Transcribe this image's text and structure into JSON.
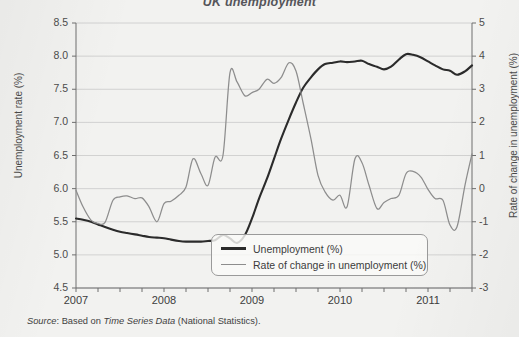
{
  "chart_data": {
    "type": "line",
    "title": "UK unemployment",
    "source": "Based on Time Series Data (National Statistics).",
    "source_prefix": "Source",
    "source_italic": "Time Series Data",
    "source_suffix": "(National Statistics).",
    "xlabel": "",
    "ylabel": "Unemployment rate (%)",
    "ylabel_right": "Rate of change in unemployment (%)",
    "ylim": [
      4.5,
      8.5
    ],
    "ylim_right": [
      -3,
      5
    ],
    "grid": true,
    "legend_position": "lower-center",
    "yticks": [
      "8.5",
      "8.0",
      "7.5",
      "7.0",
      "6.5",
      "6.0",
      "5.5",
      "5.0",
      "4.5"
    ],
    "yticks_right": [
      "5",
      "4",
      "3",
      "2",
      "1",
      "0",
      "-1",
      "-2",
      "-3"
    ],
    "xticks": [
      "2007",
      "2008",
      "2009",
      "2010",
      "2011"
    ],
    "xtick_minor_count": 18,
    "x_range": [
      "2007.00",
      "2011.50"
    ],
    "colors": {
      "unemployment": "#2b2b2b",
      "rate_of_change": "#8d8d8d",
      "grid": "#c9c9c9",
      "axis": "#6e6e6e",
      "background": "#f2f2f0"
    },
    "series": [
      {
        "name": "Unemployment (%)",
        "axis": "left",
        "x": [
          2007.0,
          2007.08,
          2007.17,
          2007.25,
          2007.33,
          2007.42,
          2007.5,
          2007.58,
          2007.67,
          2007.75,
          2007.83,
          2007.92,
          2008.0,
          2008.08,
          2008.17,
          2008.25,
          2008.33,
          2008.42,
          2008.5,
          2008.58,
          2008.67,
          2008.75,
          2008.83,
          2008.92,
          2009.0,
          2009.08,
          2009.17,
          2009.25,
          2009.33,
          2009.42,
          2009.5,
          2009.58,
          2009.67,
          2009.75,
          2009.83,
          2009.92,
          2010.0,
          2010.08,
          2010.17,
          2010.25,
          2010.33,
          2010.42,
          2010.5,
          2010.58,
          2010.67,
          2010.75,
          2010.83,
          2010.92,
          2011.0,
          2011.08,
          2011.17,
          2011.25,
          2011.33,
          2011.42,
          2011.5
        ],
        "values": [
          5.55,
          5.53,
          5.5,
          5.46,
          5.42,
          5.38,
          5.35,
          5.33,
          5.31,
          5.29,
          5.27,
          5.26,
          5.25,
          5.23,
          5.21,
          5.2,
          5.2,
          5.2,
          5.21,
          5.22,
          5.3,
          5.25,
          5.18,
          5.3,
          5.55,
          5.85,
          6.15,
          6.45,
          6.75,
          7.05,
          7.3,
          7.52,
          7.68,
          7.8,
          7.88,
          7.9,
          7.92,
          7.91,
          7.92,
          7.93,
          7.88,
          7.84,
          7.8,
          7.84,
          7.95,
          8.03,
          8.02,
          7.98,
          7.92,
          7.86,
          7.8,
          7.78,
          7.72,
          7.77,
          7.86
        ]
      },
      {
        "name": "Rate of change in unemployment (%)",
        "axis": "right",
        "x": [
          2007.0,
          2007.08,
          2007.17,
          2007.25,
          2007.33,
          2007.42,
          2007.5,
          2007.58,
          2007.67,
          2007.75,
          2007.83,
          2007.92,
          2008.0,
          2008.08,
          2008.17,
          2008.25,
          2008.33,
          2008.42,
          2008.5,
          2008.58,
          2008.67,
          2008.75,
          2008.83,
          2008.92,
          2009.0,
          2009.08,
          2009.17,
          2009.25,
          2009.33,
          2009.42,
          2009.5,
          2009.58,
          2009.67,
          2009.75,
          2009.83,
          2009.92,
          2010.0,
          2010.08,
          2010.17,
          2010.25,
          2010.33,
          2010.42,
          2010.5,
          2010.58,
          2010.67,
          2010.75,
          2010.83,
          2010.92,
          2011.0,
          2011.08,
          2011.17,
          2011.25,
          2011.33,
          2011.42,
          2011.5
        ],
        "values": [
          -0.05,
          -0.55,
          -0.95,
          -1.05,
          -1.02,
          -0.35,
          -0.25,
          -0.22,
          -0.3,
          -0.28,
          -0.55,
          -1.0,
          -0.45,
          -0.38,
          -0.2,
          0.05,
          0.9,
          0.45,
          0.1,
          0.95,
          1.0,
          3.5,
          3.22,
          2.8,
          2.9,
          3.0,
          3.3,
          3.18,
          3.35,
          3.8,
          3.55,
          2.6,
          1.5,
          0.4,
          -0.1,
          -0.35,
          -0.2,
          -0.55,
          0.9,
          0.78,
          0.1,
          -0.6,
          -0.42,
          -0.3,
          -0.2,
          0.45,
          0.52,
          0.35,
          -0.02,
          -0.3,
          -0.35,
          -1.1,
          -1.15,
          0.1,
          1.05
        ]
      }
    ]
  },
  "legend": {
    "items": [
      {
        "label": "Unemployment (%)",
        "style": "dark-thick"
      },
      {
        "label": "Rate of change in unemployment (%)",
        "style": "gray-thin"
      }
    ]
  }
}
